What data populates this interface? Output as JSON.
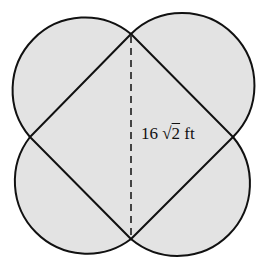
{
  "figure": {
    "colors": {
      "fill": "#e3e3e3",
      "stroke": "#111111",
      "background": "#ffffff"
    },
    "square_vertices": {
      "top": [
        131,
        34
      ],
      "right": [
        233,
        137
      ],
      "bottom": [
        131,
        239
      ],
      "left": [
        30,
        137
      ]
    },
    "diagonal": {
      "style": "dashed",
      "from": "top",
      "to": "bottom"
    },
    "label": {
      "coefficient": "16",
      "radical": "√",
      "radicand": "2",
      "unit": "ft",
      "full_text": "16 √2 ft"
    }
  }
}
